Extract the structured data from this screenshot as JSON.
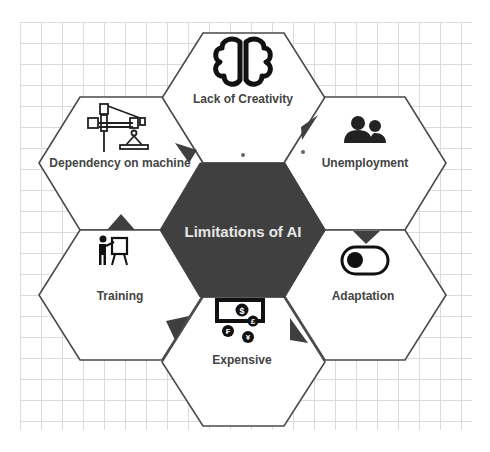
{
  "title": "Limitations  of AI",
  "colors": {
    "hex_fill": "#ffffff",
    "hex_stroke": "#4a4a4a",
    "center_fill": "#404040",
    "accent": "#3f3f3f",
    "label_text": "#444444",
    "center_text": "#e6e6e6",
    "grid": "#d8d8d8"
  },
  "nodes": [
    {
      "id": "top",
      "label": "Lack of Creativity",
      "icon": "brain-icon"
    },
    {
      "id": "upper-right",
      "label": "Unemployment",
      "icon": "people-icon"
    },
    {
      "id": "lower-right",
      "label": "Adaptation",
      "icon": "toggle-icon"
    },
    {
      "id": "bottom",
      "label": "Expensive",
      "icon": "currency-icon"
    },
    {
      "id": "lower-left",
      "label": "Training",
      "icon": "presentation-icon"
    },
    {
      "id": "upper-left",
      "label": "Dependency on machine",
      "icon": "robotic-arm-icon"
    }
  ],
  "currency_symbols": [
    "$",
    "£",
    "₣",
    "¥"
  ]
}
